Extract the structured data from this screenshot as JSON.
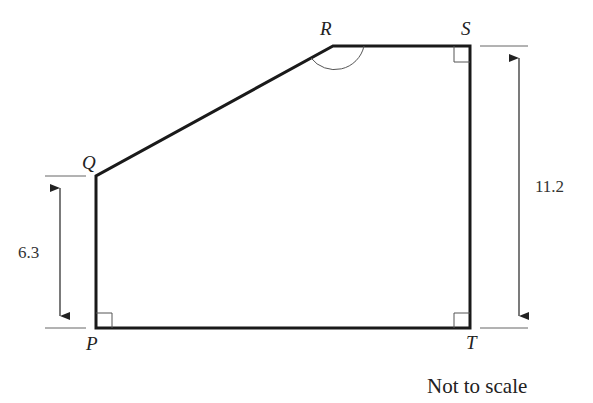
{
  "diagram": {
    "vertices": {
      "P": {
        "label": "P",
        "x": 96,
        "y": 328
      },
      "Q": {
        "label": "Q",
        "x": 96,
        "y": 176
      },
      "R": {
        "label": "R",
        "x": 333,
        "y": 46
      },
      "S": {
        "label": "S",
        "x": 470,
        "y": 46
      },
      "T": {
        "label": "T",
        "x": 470,
        "y": 328
      }
    },
    "dimensions": {
      "left": {
        "value": "6.3",
        "from": "Q",
        "to": "P"
      },
      "right": {
        "value": "11.2",
        "from": "S",
        "to": "T"
      }
    },
    "right_angles": [
      "P",
      "S",
      "T"
    ],
    "marked_angle": "R",
    "caption": "Not to scale",
    "colors": {
      "stroke": "#1a1a1a",
      "thin": "#555555"
    }
  }
}
